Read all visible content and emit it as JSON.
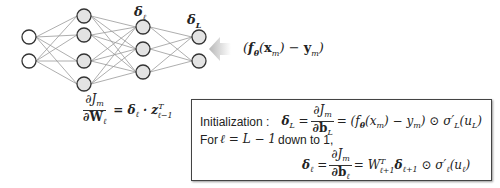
{
  "diagram": {
    "layers": [
      {
        "index": 0,
        "x": 29,
        "nodes_y": [
          37,
          61
        ],
        "fill": "#ffffff"
      },
      {
        "index": 1,
        "x": 84,
        "nodes_y": [
          16,
          35,
          61,
          84
        ],
        "fill": "#e3e3e3"
      },
      {
        "index": 2,
        "x": 143,
        "nodes_y": [
          27,
          49,
          72
        ],
        "fill": "#e3e3e3"
      },
      {
        "index": 3,
        "x": 199,
        "nodes_y": [
          37,
          61
        ],
        "fill": "#e3e3e3"
      }
    ],
    "node_radius": 7,
    "edge_color": "#999999",
    "node_stroke": "#333333",
    "labels": {
      "delta_l": "δℓ",
      "delta_L": "δL"
    },
    "error_input": {
      "text_prefix": "(",
      "f": "f",
      "theta": "θ",
      "x": "x",
      "m": "m",
      "minus": " − ",
      "y": "y",
      "text_suffix": ")"
    },
    "weight_gradient": {
      "numerator": "∂J",
      "numerator_sub": "m",
      "denominator": "∂W",
      "denominator_sub": "ℓ",
      "rhs": "= δ",
      "rhs_sub": "ℓ",
      "dot": " · z",
      "sup": "T",
      "sub": "ℓ−1"
    },
    "box": {
      "init_label": "Initialization :",
      "init_lhs": "δ",
      "init_lhs_sub": "L",
      "eq": "=",
      "init_num": "∂J",
      "init_num_sub": "m",
      "init_den": "∂b",
      "init_den_sub": "L",
      "init_rhs_1": "= (f",
      "init_rhs_theta": "θ",
      "init_rhs_2": "(x",
      "init_rhs_m1": "m",
      "init_rhs_3": ") − y",
      "init_rhs_m2": "m",
      "init_rhs_4": ") ⊙ σ′",
      "init_rhs_sub": "L",
      "init_rhs_5": "(u",
      "init_rhs_sub2": "L",
      "init_rhs_6": ")",
      "loop_prefix": "For ",
      "loop_math": "ℓ = L − 1",
      "loop_suffix": " down to 1,",
      "rec_lhs": "δ",
      "rec_lhs_sub": "ℓ",
      "rec_num": "∂J",
      "rec_num_sub": "m",
      "rec_den": "∂b",
      "rec_den_sub": "ℓ",
      "rec_rhs_1": "= W",
      "rec_rhs_sup": "T",
      "rec_rhs_sub": "ℓ+1",
      "rec_rhs_2": "δ",
      "rec_rhs_sub2": "ℓ+1",
      "rec_rhs_3": " ⊙ σ′",
      "rec_rhs_sub3": "ℓ",
      "rec_rhs_4": "(u",
      "rec_rhs_sub4": "ℓ",
      "rec_rhs_5": ")"
    }
  }
}
